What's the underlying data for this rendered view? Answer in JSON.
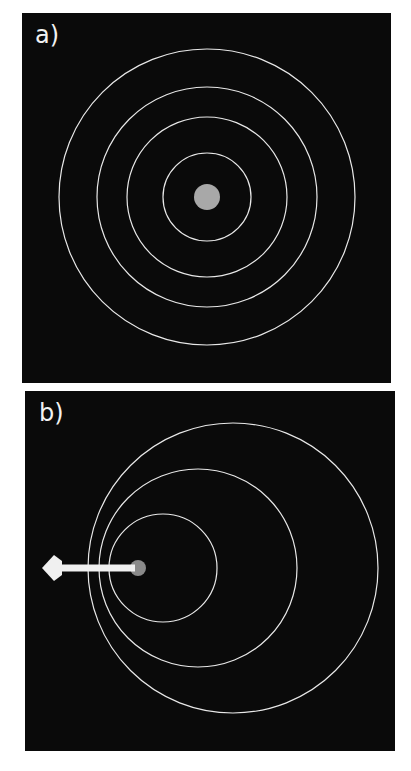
{
  "panels": [
    {
      "label": "a)",
      "description": "Concentric wavefronts around stationary source",
      "source": {
        "cx": 185,
        "cy": 184,
        "r": 13,
        "color": "#a8a8a8"
      },
      "circles": [
        {
          "cx": 185,
          "cy": 184,
          "r": 148
        },
        {
          "cx": 185,
          "cy": 184,
          "r": 110
        },
        {
          "cx": 185,
          "cy": 184,
          "r": 80
        },
        {
          "cx": 185,
          "cy": 184,
          "r": 44
        }
      ]
    },
    {
      "label": "b)",
      "description": "Wavefronts from source moving left (Doppler effect)",
      "source": {
        "cx": 113,
        "cy": 177,
        "r": 8,
        "color": "#8a8a8a"
      },
      "circles": [
        {
          "cx": 208,
          "cy": 177,
          "r": 145
        },
        {
          "cx": 173,
          "cy": 177,
          "r": 99
        },
        {
          "cx": 138,
          "cy": 177,
          "r": 54
        }
      ],
      "arrow": {
        "x1": 110,
        "y1": 177,
        "x2": 17,
        "y2": 177,
        "direction": "left",
        "color": "#f0f0f0"
      }
    }
  ],
  "colors": {
    "background": "#0a0a0a",
    "wavefront": "#e8e8e8",
    "page": "#ffffff"
  }
}
